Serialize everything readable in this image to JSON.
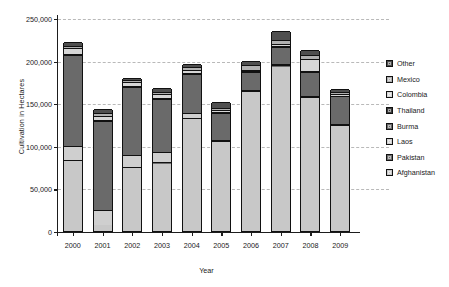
{
  "chart_data": {
    "type": "bar",
    "subtype": "stacked-bar",
    "title": "",
    "xlabel": "Year",
    "ylabel": "Cultivation in Hectares",
    "categories": [
      "2000",
      "2001",
      "2002",
      "2003",
      "2004",
      "2005",
      "2006",
      "2007",
      "2008",
      "2009"
    ],
    "ylim": [
      0,
      250000
    ],
    "yticks": [
      0,
      50000,
      100000,
      150000,
      200000,
      250000
    ],
    "ytick_labels": [
      "0",
      "50,000",
      "100,000",
      "150,000",
      "200,000",
      "250,000"
    ],
    "grid": true,
    "grid_axis": "y",
    "legend_position": "right",
    "stack_order_bottom_to_top": [
      "Afghanistan",
      "Pakistan",
      "Laos",
      "Burma",
      "Thailand",
      "Colombia",
      "Mexico",
      "Other"
    ],
    "series": [
      {
        "name": "Afghanistan",
        "color": "#c8c8c8",
        "values": [
          82000,
          7000,
          74000,
          79000,
          131000,
          104000,
          163000,
          193000,
          156000,
          123000
        ]
      },
      {
        "name": "Pakistan",
        "color": "#6e6e6e",
        "values": [
          1000,
          500,
          1000,
          2000,
          1500,
          1500,
          1500,
          1500,
          1500,
          1500
        ]
      },
      {
        "name": "Laos",
        "color": "#cfcfcf",
        "values": [
          17000,
          17000,
          14000,
          12000,
          6500,
          1500,
          1000,
          1000,
          1000,
          1500
        ]
      },
      {
        "name": "Burma",
        "color": "#6a6a6a",
        "values": [
          107000,
          105000,
          80000,
          62000,
          45000,
          32000,
          21000,
          21000,
          28000,
          32000
        ]
      },
      {
        "name": "Thailand",
        "color": "#3c3c3c",
        "values": [
          1000,
          1000,
          1000,
          1000,
          1000,
          1000,
          1000,
          1000,
          1000,
          1000
        ]
      },
      {
        "name": "Colombia",
        "color": "#d6d6d6",
        "values": [
          6500,
          4500,
          4500,
          4500,
          4000,
          2000,
          2000,
          1500,
          14000,
          1500
        ]
      },
      {
        "name": "Mexico",
        "color": "#b0b0b0",
        "values": [
          2500,
          3000,
          2500,
          3000,
          3000,
          2500,
          5000,
          5000,
          5000,
          2500
        ]
      },
      {
        "name": "Other",
        "color": "#4f4f4f",
        "values": [
          5000,
          5000,
          3000,
          4500,
          4000,
          6500,
          5500,
          11000,
          5500,
          4000
        ]
      }
    ],
    "totals": [
      222000,
      143000,
      180000,
      168000,
      196000,
      151000,
      200000,
      234000,
      212000,
      167000
    ],
    "legend_entries_top_to_bottom": [
      {
        "label": "Other",
        "color": "#4f4f4f"
      },
      {
        "label": "Mexico",
        "color": "#b0b0b0"
      },
      {
        "label": "Colombia",
        "color": "#d6d6d6"
      },
      {
        "label": "Thailand",
        "color": "#3c3c3c"
      },
      {
        "label": "Burma",
        "color": "#6a6a6a"
      },
      {
        "label": "Laos",
        "color": "#cfcfcf"
      },
      {
        "label": "Pakistan",
        "color": "#6e6e6e"
      },
      {
        "label": "Afghanistan",
        "color": "#c8c8c8"
      }
    ]
  },
  "axes": {
    "y_title": "Cultivation in Hectares",
    "x_title": "Year"
  }
}
